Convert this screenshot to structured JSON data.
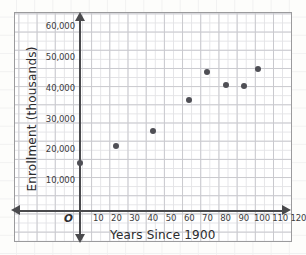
{
  "chart_data": {
    "type": "scatter",
    "title": "",
    "xlabel": "Years Since 1900",
    "ylabel": "Enrollment (thousands)",
    "origin_label": "O",
    "xlim": [
      0,
      125
    ],
    "ylim": [
      0,
      63000
    ],
    "grid": true,
    "legend": "none",
    "xticks": [
      "10",
      "20",
      "30",
      "40",
      "50",
      "60",
      "70",
      "80",
      "90",
      "100",
      "110",
      "120"
    ],
    "xtick_values": [
      10,
      20,
      30,
      40,
      50,
      60,
      70,
      80,
      90,
      100,
      110,
      120
    ],
    "yticks": [
      "10,000",
      "20,000",
      "30,000",
      "40,000",
      "50,000",
      "60,000"
    ],
    "ytick_values": [
      10000,
      20000,
      30000,
      40000,
      50000,
      60000
    ],
    "points": [
      {
        "x": 0,
        "y": 15500
      },
      {
        "x": 20,
        "y": 21000
      },
      {
        "x": 40,
        "y": 26000
      },
      {
        "x": 60,
        "y": 36000
      },
      {
        "x": 70,
        "y": 45000
      },
      {
        "x": 80,
        "y": 41000
      },
      {
        "x": 90,
        "y": 40500
      },
      {
        "x": 98,
        "y": 46000
      }
    ],
    "marker_color": "#4f4f55",
    "axis_color": "#4a4a4d",
    "grid_color": "#c9c9ce"
  }
}
